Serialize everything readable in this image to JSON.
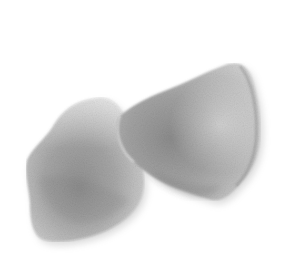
{
  "image": {
    "subject": "two white rose petals",
    "background_color": "#ffffff",
    "petals": [
      {
        "name": "left-petal",
        "base_color": "#a8a8a8",
        "highlight_color": "#e2e2e2",
        "shadow_color": "#7e7e7e"
      },
      {
        "name": "right-petal",
        "base_color": "#ababab",
        "highlight_color": "#e8e8e8",
        "shadow_color": "#808080"
      }
    ]
  }
}
